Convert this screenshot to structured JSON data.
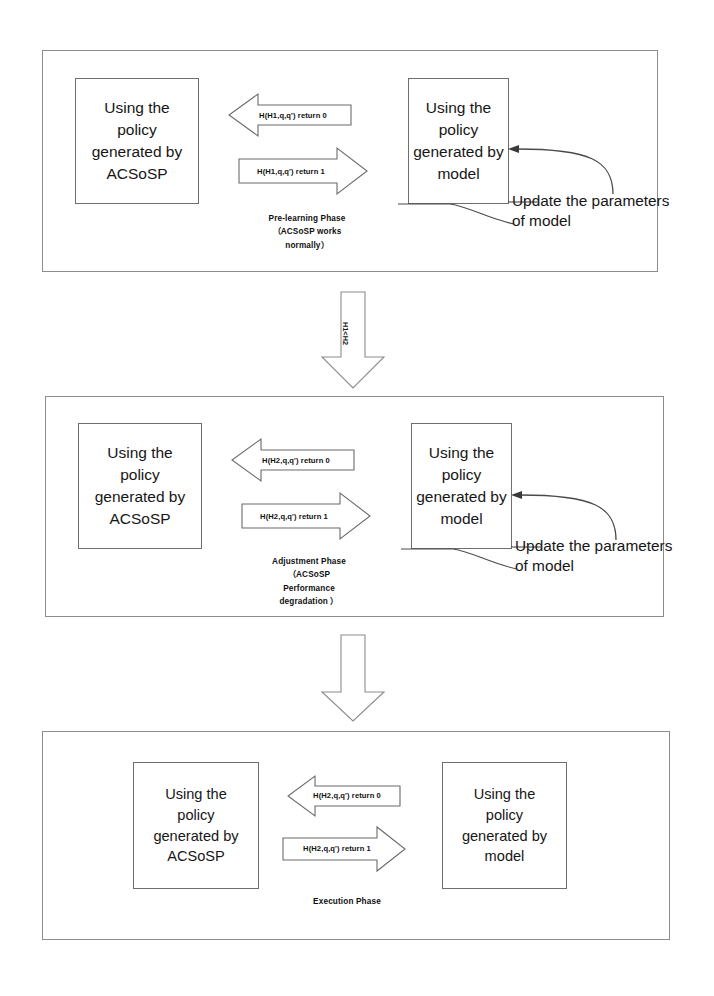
{
  "diagram": {
    "colors": {
      "panel_border": "#8c8c8c",
      "box_border": "#6e6e6e",
      "arrow_stroke": "#6b6b6b",
      "text": "#161616",
      "background": "#ffffff"
    }
  },
  "phases": [
    {
      "id": "pre-learning",
      "caption": "Pre-learning Phase\n（ACSoSP works\nnormally）",
      "left_box": "Using the\npolicy\ngenerated by\nACSoSP",
      "right_box": "Using the\npolicy\ngenerated by\nmodel",
      "arrow_back_label": "H(H1,q,q') return 0",
      "arrow_forward_label": "H(H1,q,q') return 1",
      "update_note": "Update the parameters\nof model"
    },
    {
      "id": "adjustment",
      "caption": "Adjustment Phase\n（ACSoSP\nPerformance\ndegradation ）",
      "left_box": "Using the\npolicy\ngenerated by\nACSoSP",
      "right_box": "Using the\npolicy\ngenerated by\nmodel",
      "arrow_back_label": "H(H2,q,q') return 0",
      "arrow_forward_label": "H(H2,q,q') return 1",
      "update_note": "Update the parameters\nof model"
    },
    {
      "id": "execution",
      "caption": "Execution Phase",
      "left_box": "Using the\npolicy\ngenerated by\nACSoSP",
      "right_box": "Using the\npolicy\ngenerated by\nmodel",
      "arrow_back_label": "H(H2,q,q') return 0",
      "arrow_forward_label": "H(H2,q,q') return 1",
      "update_note": ""
    }
  ],
  "connectors": [
    {
      "id": "connector-1",
      "label": "H1<H2"
    },
    {
      "id": "connector-2",
      "label": ""
    }
  ]
}
